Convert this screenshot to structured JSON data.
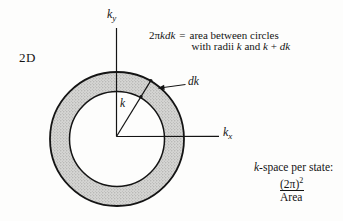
{
  "figure": {
    "background": "#fdfdfc",
    "ink": "#141414",
    "annulus_fill": "#d6d6d4",
    "dimension_label": "2D",
    "y_axis": {
      "base": "k",
      "sub": "y"
    },
    "x_axis": {
      "base": "k",
      "sub": "x"
    },
    "radius_label": "k",
    "thickness_label": "dk",
    "equation": {
      "lhs_roman": "2π",
      "lhs_italic": "kdk",
      "equals": "=",
      "line1": "area between circles",
      "line2": [
        {
          "text": "with radii "
        },
        {
          "text": "k"
        },
        {
          "text": " and "
        },
        {
          "text": "k"
        },
        {
          "text": " + "
        },
        {
          "text": "dk"
        }
      ]
    },
    "kspace_note": {
      "heading_italic": "k",
      "heading_roman": "-space per state:",
      "numerator": "(2π)",
      "numerator_sup": "2",
      "denominator": "Area"
    }
  }
}
